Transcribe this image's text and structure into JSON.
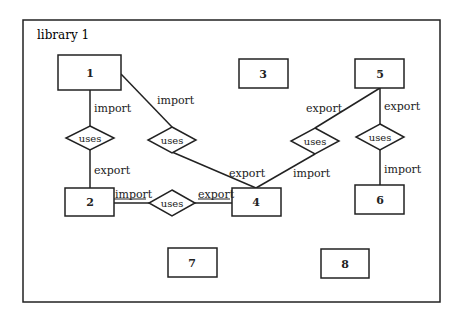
{
  "diagram": {
    "frame": {
      "label": "library 1",
      "x": 23,
      "y": 20,
      "w": 417,
      "h": 282
    },
    "entities": [
      {
        "id": "1",
        "label": "1",
        "x": 58,
        "y": 55,
        "w": 63,
        "h": 35
      },
      {
        "id": "2",
        "label": "2",
        "x": 65,
        "y": 188,
        "w": 49,
        "h": 28
      },
      {
        "id": "3",
        "label": "3",
        "x": 239,
        "y": 59,
        "w": 49,
        "h": 29
      },
      {
        "id": "4",
        "label": "4",
        "x": 232,
        "y": 188,
        "w": 49,
        "h": 28
      },
      {
        "id": "5",
        "label": "5",
        "x": 355,
        "y": 59,
        "w": 49,
        "h": 29
      },
      {
        "id": "6",
        "label": "6",
        "x": 355,
        "y": 185,
        "w": 49,
        "h": 29
      },
      {
        "id": "7",
        "label": "7",
        "x": 168,
        "y": 248,
        "w": 49,
        "h": 29
      },
      {
        "id": "8",
        "label": "8",
        "x": 321,
        "y": 249,
        "w": 48,
        "h": 29
      }
    ],
    "relationships": [
      {
        "id": "r1",
        "label": "uses",
        "cx": 90,
        "cy": 138
      },
      {
        "id": "r2",
        "label": "uses",
        "cx": 172,
        "cy": 140
      },
      {
        "id": "r3",
        "label": "uses",
        "cx": 315,
        "cy": 141
      },
      {
        "id": "r4",
        "label": "uses",
        "cx": 380,
        "cy": 137
      },
      {
        "id": "r5",
        "label": "uses",
        "cx": 172,
        "cy": 203
      }
    ],
    "edges": [
      {
        "from": "1",
        "to": "r1",
        "label": "import"
      },
      {
        "from": "r1",
        "to": "2",
        "label": "export"
      },
      {
        "from": "1",
        "to": "r2",
        "label": "import"
      },
      {
        "from": "r2",
        "to": "4",
        "label": "export"
      },
      {
        "from": "5",
        "to": "r3",
        "label": "export"
      },
      {
        "from": "r3",
        "to": "4",
        "label": "import"
      },
      {
        "from": "5",
        "to": "r4",
        "label": "export"
      },
      {
        "from": "r4",
        "to": "6",
        "label": "import"
      },
      {
        "from": "2",
        "to": "r5",
        "label": "import"
      },
      {
        "from": "r5",
        "to": "4",
        "label": "export"
      }
    ]
  }
}
